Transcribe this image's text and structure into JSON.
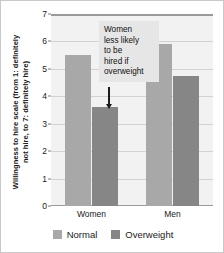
{
  "chart_data": {
    "type": "bar",
    "title": "",
    "xlabel": "",
    "ylabel_line1": "Willingness to hire scale (from 1: definitely",
    "ylabel_line2": "not hire, to 7: definitely hire)",
    "categories": [
      "Women",
      "Men"
    ],
    "series": [
      {
        "name": "Normal",
        "color": "#a8a8a8",
        "values": [
          5.5,
          5.9
        ]
      },
      {
        "name": "Overweight",
        "color": "#868686",
        "values": [
          3.6,
          4.75
        ]
      }
    ],
    "ylim": [
      0,
      7
    ],
    "yticks": [
      0,
      1,
      2,
      3,
      4,
      5,
      6,
      7
    ],
    "ytick_labels": [
      "0",
      "1",
      "2",
      "3",
      "4",
      "5",
      "6",
      "7"
    ],
    "grid": true,
    "legend_position": "bottom",
    "annotations": [
      {
        "lines": [
          "Women",
          "less likely",
          "to be",
          "hired if",
          "overweight"
        ],
        "arrow": "down",
        "points_to": "Women / Overweight bar"
      }
    ]
  }
}
